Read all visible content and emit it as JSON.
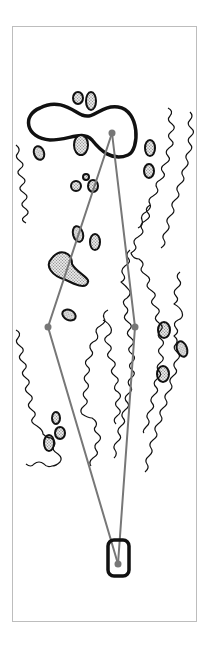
{
  "diagram": {
    "type": "golf-hole-layout",
    "colors": {
      "frame": "#bdbdbd",
      "outline": "#111111",
      "route": "#777777",
      "bunker_fill": "#d8d8d8"
    },
    "elements": {
      "green": "green-outline",
      "pin": "pin-marker",
      "tee": "tee-box",
      "routes": [
        "left-dogleg-route",
        "right-straight-route"
      ],
      "hazards": [
        "bunkers",
        "rough-lines"
      ]
    }
  }
}
